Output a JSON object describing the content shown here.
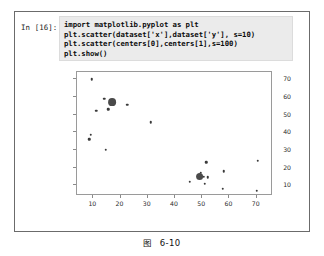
{
  "cell": {
    "prompt_label": "In [16]:",
    "code_lines": [
      "import matplotlib.pyplot as plt",
      "plt.scatter(dataset['x'],dataset['y'], s=10)",
      "plt.scatter(centers[0],centers[1],s=100)",
      "plt.show()"
    ],
    "input_bg": "#ebebeb",
    "border_color": "#6b6b6b"
  },
  "caption": {
    "prefix": "图",
    "number": "6-10"
  },
  "chart_data": {
    "type": "scatter",
    "title": "",
    "xlabel": "",
    "ylabel": "",
    "xlim": [
      4,
      76
    ],
    "ylim": [
      4,
      74
    ],
    "grid": false,
    "legend": "none",
    "xticks": [
      10,
      20,
      30,
      40,
      50,
      60,
      70
    ],
    "yticks": [
      10,
      20,
      30,
      40,
      50,
      60,
      70
    ],
    "series": [
      {
        "name": "dataset",
        "marker_size": 10,
        "color": "#3a3a3a",
        "points": [
          [
            9.5,
            70.0
          ],
          [
            14.0,
            59.0
          ],
          [
            11.0,
            52.0
          ],
          [
            15.5,
            53.0
          ],
          [
            22.5,
            55.5
          ],
          [
            31.0,
            45.5
          ],
          [
            9.0,
            38.5
          ],
          [
            8.5,
            36.0
          ],
          [
            14.5,
            30.0
          ],
          [
            45.5,
            12.0
          ],
          [
            49.5,
            17.0
          ],
          [
            50.5,
            15.0
          ],
          [
            51.5,
            23.0
          ],
          [
            52.0,
            14.5
          ],
          [
            51.0,
            11.0
          ],
          [
            58.0,
            18.0
          ],
          [
            57.5,
            8.0
          ],
          [
            70.5,
            24.0
          ],
          [
            70.0,
            7.0
          ]
        ]
      },
      {
        "name": "centers",
        "marker_size": 100,
        "color": "#4a4a4a",
        "points": [
          [
            17.0,
            57.0
          ],
          [
            49.0,
            15.0
          ]
        ]
      }
    ]
  }
}
